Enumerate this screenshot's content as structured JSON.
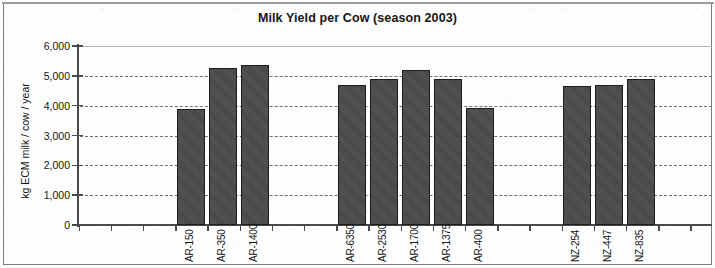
{
  "figure": {
    "title": "Milk Yield per Cow (season 2003)",
    "y_axis_title": "kg ECM milk / cow / year",
    "y_ticks": [
      "6,000",
      "5,000",
      "4,000",
      "3,000",
      "2,000",
      "1,000",
      "0"
    ],
    "bar_color": "#4a4a4a",
    "grid_color": "#6e6e6e",
    "axis_color": "#4a4a4a"
  },
  "chart_data": {
    "type": "bar",
    "title": "Milk Yield per Cow (season 2003)",
    "xlabel": "",
    "ylabel": "kg ECM milk / cow / year",
    "ylim": [
      0,
      6000
    ],
    "ytick_values": [
      0,
      1000,
      2000,
      3000,
      4000,
      5000,
      6000
    ],
    "ytick_labels": [
      "0",
      "1,000",
      "2,000",
      "3,000",
      "4,000",
      "5,000",
      "6,000"
    ],
    "grid": "horizontal-dashed",
    "legend": "none",
    "categories": [
      "AR-150",
      "AR-350",
      "AR-1400",
      "AR-6350",
      "AR-2530",
      "AR-1700",
      "AR-1375",
      "AR-400",
      "NZ-254",
      "NZ-447",
      "NZ-835"
    ],
    "values": [
      3880,
      5270,
      5380,
      4690,
      4880,
      5200,
      4880,
      3920,
      4660,
      4680,
      4900
    ],
    "groups": [
      {
        "name": "AR group 1",
        "categories": [
          "AR-150",
          "AR-350",
          "AR-1400"
        ]
      },
      {
        "name": "AR group 2",
        "categories": [
          "AR-6350",
          "AR-2530",
          "AR-1700",
          "AR-1375",
          "AR-400"
        ]
      },
      {
        "name": "NZ group",
        "categories": [
          "NZ-254",
          "NZ-447",
          "NZ-835"
        ]
      }
    ]
  }
}
